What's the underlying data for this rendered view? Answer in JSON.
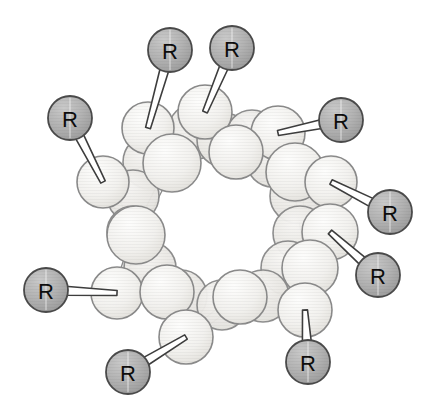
{
  "figure": {
    "width": 439,
    "height": 418,
    "background_color": "#ffffff"
  },
  "style": {
    "ring_atom_fill": "#f2f1ee",
    "ring_atom_fill_alt": "#eceae6",
    "ring_atom_stroke": "#8a8a8a",
    "ring_atom_stroke_width": 1.6,
    "r_group_fill": "#b2b2b2",
    "r_group_fill_dark": "#9a9a9a",
    "r_group_stroke": "#4a4a4a",
    "r_group_stroke_width": 1.8,
    "bond_fill": "#ffffff",
    "bond_stroke": "#3d3d3d",
    "bond_stroke_width": 1.6,
    "label_color": "#0d0d0d",
    "label_font_size": 22
  },
  "r_groups": [
    {
      "id": "r-top-left-inner",
      "label": "R",
      "cx": 170,
      "cy": 50,
      "r": 22,
      "anchor_x": 148,
      "anchor_y": 128,
      "bond_w_near": 5,
      "bond_w_far": 9
    },
    {
      "id": "r-top-right-inner",
      "label": "R",
      "cx": 232,
      "cy": 48,
      "r": 22,
      "anchor_x": 205,
      "anchor_y": 112,
      "bond_w_near": 5,
      "bond_w_far": 9
    },
    {
      "id": "r-upper-left",
      "label": "R",
      "cx": 70,
      "cy": 118,
      "r": 22,
      "anchor_x": 103,
      "anchor_y": 182,
      "bond_w_near": 5,
      "bond_w_far": 9
    },
    {
      "id": "r-upper-right",
      "label": "R",
      "cx": 341,
      "cy": 120,
      "r": 22,
      "anchor_x": 278,
      "anchor_y": 133,
      "bond_w_near": 5,
      "bond_w_far": 9
    },
    {
      "id": "r-right-upper",
      "label": "R",
      "cx": 390,
      "cy": 212,
      "r": 22,
      "anchor_x": 331,
      "anchor_y": 182,
      "bond_w_near": 5,
      "bond_w_far": 9
    },
    {
      "id": "r-right-lower",
      "label": "R",
      "cx": 378,
      "cy": 275,
      "r": 22,
      "anchor_x": 330,
      "anchor_y": 232,
      "bond_w_near": 5,
      "bond_w_far": 9
    },
    {
      "id": "r-left-lower",
      "label": "R",
      "cx": 46,
      "cy": 290,
      "r": 22,
      "anchor_x": 117,
      "anchor_y": 293,
      "bond_w_near": 5,
      "bond_w_far": 9
    },
    {
      "id": "r-bottom-left",
      "label": "R",
      "cx": 128,
      "cy": 372,
      "r": 22,
      "anchor_x": 186,
      "anchor_y": 337,
      "bond_w_near": 5,
      "bond_w_far": 9
    },
    {
      "id": "r-bottom-right",
      "label": "R",
      "cx": 308,
      "cy": 362,
      "r": 22,
      "anchor_x": 305,
      "anchor_y": 310,
      "bond_w_near": 5,
      "bond_w_far": 9
    }
  ],
  "ring_atoms_back": [
    {
      "cx": 196,
      "cy": 131,
      "r": 28
    },
    {
      "cx": 224,
      "cy": 140,
      "r": 27
    },
    {
      "cx": 252,
      "cy": 136,
      "r": 26
    },
    {
      "cx": 150,
      "cy": 162,
      "r": 27
    },
    {
      "cx": 273,
      "cy": 160,
      "r": 27
    },
    {
      "cx": 133,
      "cy": 196,
      "r": 26
    },
    {
      "cx": 297,
      "cy": 196,
      "r": 27
    },
    {
      "cx": 133,
      "cy": 232,
      "r": 26
    },
    {
      "cx": 300,
      "cy": 233,
      "r": 27
    },
    {
      "cx": 150,
      "cy": 268,
      "r": 26
    },
    {
      "cx": 288,
      "cy": 268,
      "r": 27
    },
    {
      "cx": 181,
      "cy": 296,
      "r": 26
    },
    {
      "cx": 263,
      "cy": 296,
      "r": 26
    },
    {
      "cx": 222,
      "cy": 305,
      "r": 25
    }
  ],
  "ring_atoms_front": [
    {
      "cx": 148,
      "cy": 128,
      "r": 26
    },
    {
      "cx": 205,
      "cy": 112,
      "r": 27
    },
    {
      "cx": 278,
      "cy": 133,
      "r": 27
    },
    {
      "cx": 172,
      "cy": 163,
      "r": 29
    },
    {
      "cx": 236,
      "cy": 152,
      "r": 27
    },
    {
      "cx": 103,
      "cy": 182,
      "r": 26
    },
    {
      "cx": 295,
      "cy": 172,
      "r": 29
    },
    {
      "cx": 331,
      "cy": 182,
      "r": 26
    },
    {
      "cx": 136,
      "cy": 235,
      "r": 29
    },
    {
      "cx": 330,
      "cy": 232,
      "r": 28
    },
    {
      "cx": 310,
      "cy": 268,
      "r": 28
    },
    {
      "cx": 117,
      "cy": 293,
      "r": 26
    },
    {
      "cx": 167,
      "cy": 292,
      "r": 27
    },
    {
      "cx": 240,
      "cy": 297,
      "r": 27
    },
    {
      "cx": 305,
      "cy": 310,
      "r": 27
    },
    {
      "cx": 186,
      "cy": 337,
      "r": 27
    }
  ],
  "ring_bonds": [
    {
      "x1": 148,
      "y1": 128,
      "x2": 172,
      "y2": 163,
      "w": 8
    },
    {
      "x1": 205,
      "y1": 112,
      "x2": 236,
      "y2": 152,
      "w": 8
    },
    {
      "x1": 236,
      "y1": 152,
      "x2": 278,
      "y2": 133,
      "w": 8
    },
    {
      "x1": 278,
      "y1": 133,
      "x2": 295,
      "y2": 172,
      "w": 8
    },
    {
      "x1": 103,
      "y1": 182,
      "x2": 136,
      "y2": 235,
      "w": 8
    },
    {
      "x1": 103,
      "y1": 182,
      "x2": 172,
      "y2": 163,
      "w": 8
    },
    {
      "x1": 136,
      "y1": 235,
      "x2": 117,
      "y2": 293,
      "w": 8
    },
    {
      "x1": 117,
      "y1": 293,
      "x2": 167,
      "y2": 292,
      "w": 8
    },
    {
      "x1": 167,
      "y1": 292,
      "x2": 186,
      "y2": 337,
      "w": 8
    },
    {
      "x1": 186,
      "y1": 337,
      "x2": 240,
      "y2": 297,
      "w": 8
    },
    {
      "x1": 240,
      "y1": 297,
      "x2": 305,
      "y2": 310,
      "w": 8
    },
    {
      "x1": 305,
      "y1": 310,
      "x2": 310,
      "y2": 268,
      "w": 8
    },
    {
      "x1": 310,
      "y1": 268,
      "x2": 330,
      "y2": 232,
      "w": 8
    },
    {
      "x1": 330,
      "y1": 232,
      "x2": 331,
      "y2": 182,
      "w": 8
    },
    {
      "x1": 295,
      "y1": 172,
      "x2": 331,
      "y2": 182,
      "w": 8
    },
    {
      "x1": 172,
      "y1": 163,
      "x2": 136,
      "y2": 235,
      "w": 7
    },
    {
      "x1": 295,
      "y1": 172,
      "x2": 310,
      "y2": 268,
      "w": 7
    }
  ]
}
